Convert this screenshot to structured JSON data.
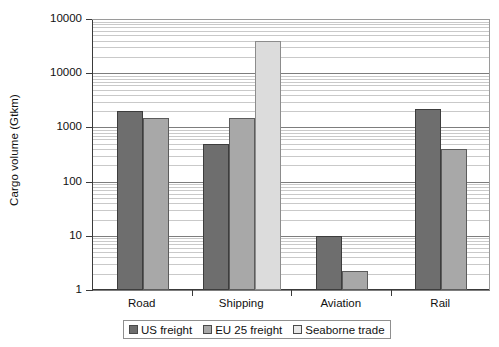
{
  "chart_data": {
    "type": "bar",
    "title": "",
    "subtitle": "",
    "xlabel": "",
    "ylabel": "Cargo volume (Gtkm)",
    "yscale": "log",
    "ylim": [
      1,
      100000
    ],
    "grid": true,
    "grid_minor": true,
    "legend_position": "bottom",
    "orientation": "vertical",
    "grouped": true,
    "categories": [
      "Road",
      "Shipping",
      "Aviation",
      "Rail"
    ],
    "ytick_labels": [
      "10000",
      "10000",
      "1000",
      "100",
      "10",
      "1"
    ],
    "ytick_values": [
      100000,
      10000,
      1000,
      100,
      10,
      1
    ],
    "series": [
      {
        "name": "US freight",
        "color": "#6e6e6e",
        "values": [
          2000,
          500,
          10,
          2200
        ]
      },
      {
        "name": "EU 25 freight",
        "color": "#a8a8a8",
        "values": [
          1500,
          1500,
          2.2,
          400
        ]
      },
      {
        "name": "Seaborne trade",
        "color": "#e8e8e8",
        "values": [
          null,
          40000,
          null,
          null
        ]
      }
    ]
  },
  "axis": {
    "y_title": "Cargo volume (Gtkm)"
  },
  "legend": {
    "entries": [
      {
        "label": "US freight"
      },
      {
        "label": "EU 25 freight"
      },
      {
        "label": "Seaborne trade"
      }
    ]
  }
}
